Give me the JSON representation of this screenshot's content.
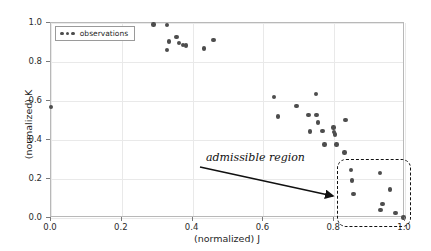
{
  "chart_data": {
    "type": "scatter",
    "title": "",
    "xlabel": "(normalized) J",
    "ylabel": "(normalized) K",
    "xlim": [
      0.0,
      1.0
    ],
    "ylim": [
      0.0,
      1.0
    ],
    "xticks": [
      "0.0",
      "0.2",
      "0.4",
      "0.6",
      "0.8",
      "1.0"
    ],
    "xtick_values": [
      0.0,
      0.2,
      0.4,
      0.6,
      0.8,
      1.0
    ],
    "yticks": [
      "0.0",
      "0.2",
      "0.4",
      "0.6",
      "0.8",
      "1.0"
    ],
    "ytick_values": [
      0.0,
      0.2,
      0.4,
      0.6,
      0.8,
      1.0
    ],
    "grid": true,
    "legend_position": "upper left",
    "marker_color": "#4d4d4d",
    "series": [
      {
        "name": "observations",
        "points": [
          [
            0.0,
            0.57
          ],
          [
            0.289,
            0.993
          ],
          [
            0.327,
            0.99
          ],
          [
            0.327,
            0.861
          ],
          [
            0.333,
            0.905
          ],
          [
            0.354,
            0.928
          ],
          [
            0.362,
            0.898
          ],
          [
            0.372,
            0.886
          ],
          [
            0.382,
            0.884
          ],
          [
            0.432,
            0.87
          ],
          [
            0.459,
            0.912
          ],
          [
            0.63,
            0.619
          ],
          [
            0.641,
            0.521
          ],
          [
            0.694,
            0.573
          ],
          [
            0.727,
            0.527
          ],
          [
            0.731,
            0.443
          ],
          [
            0.748,
            0.636
          ],
          [
            0.75,
            0.528
          ],
          [
            0.754,
            0.49
          ],
          [
            0.767,
            0.447
          ],
          [
            0.773,
            0.376
          ],
          [
            0.798,
            0.464
          ],
          [
            0.8,
            0.441
          ],
          [
            0.802,
            0.428
          ],
          [
            0.806,
            0.376
          ],
          [
            0.832,
            0.503
          ],
          [
            0.829,
            0.336
          ],
          [
            0.847,
            0.245
          ],
          [
            0.851,
            0.192
          ],
          [
            0.855,
            0.123
          ],
          [
            0.93,
            0.232
          ],
          [
            0.931,
            0.041
          ],
          [
            0.936,
            0.071
          ],
          [
            0.958,
            0.147
          ],
          [
            0.973,
            0.026
          ],
          [
            0.996,
            0.002
          ]
        ]
      }
    ],
    "annotations": [
      {
        "label": "admissible region",
        "style": "italic-serif",
        "points_to": "admissible-region-box"
      }
    ],
    "regions": [
      {
        "name": "admissible region",
        "style": "dashed rounded rectangle",
        "x_range": [
          0.81,
          1.03
        ],
        "y_range": [
          -0.05,
          0.29
        ]
      }
    ]
  },
  "legend": {
    "entries": [
      {
        "label": "observations"
      }
    ]
  },
  "annotation": {
    "text": "admissible region"
  },
  "axes": {
    "x_title": "(normalized) J",
    "y_title": "(normalized) K"
  }
}
